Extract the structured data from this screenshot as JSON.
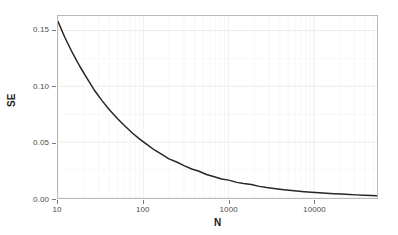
{
  "chart_data": {
    "type": "line",
    "title": "",
    "xlabel": "N",
    "ylabel": "SE",
    "xscale": "log",
    "yscale": "linear",
    "xlim": [
      10,
      55000
    ],
    "ylim": [
      0.0,
      0.163
    ],
    "grid": true,
    "legend": null,
    "formula": "SE = 0.5 / sqrt(N)",
    "xticks": [
      10,
      100,
      1000,
      10000
    ],
    "xtick_labels": [
      "10",
      "100",
      "1000",
      "10000"
    ],
    "yticks": [
      0.0,
      0.05,
      0.1,
      0.15
    ],
    "ytick_labels": [
      "0.00",
      "0.05",
      "0.10",
      "0.15"
    ],
    "series": [
      {
        "name": "SE",
        "color": "#262626",
        "x": [
          10,
          12,
          15,
          18,
          22,
          27,
          33,
          40,
          50,
          60,
          75,
          90,
          110,
          135,
          165,
          200,
          250,
          300,
          370,
          450,
          550,
          680,
          830,
          1000,
          1250,
          1500,
          1850,
          2300,
          2800,
          3400,
          4200,
          5100,
          6300,
          7700,
          9400,
          11500,
          14000,
          17200,
          21000,
          26000,
          31500,
          38500,
          47000,
          55000
        ],
        "y": [
          0.158,
          0.144,
          0.129,
          0.118,
          0.107,
          0.096,
          0.087,
          0.079,
          0.071,
          0.065,
          0.058,
          0.053,
          0.048,
          0.043,
          0.039,
          0.035,
          0.032,
          0.029,
          0.026,
          0.024,
          0.021,
          0.019,
          0.017,
          0.016,
          0.014,
          0.013,
          0.012,
          0.0104,
          0.0094,
          0.0086,
          0.0077,
          0.007,
          0.0063,
          0.0057,
          0.0052,
          0.0047,
          0.0042,
          0.0038,
          0.0035,
          0.0031,
          0.0028,
          0.0025,
          0.0023,
          0.0021
        ]
      }
    ]
  },
  "axes": {
    "y_title": "SE",
    "x_title": "N"
  },
  "style": {
    "panel_border_color": "#b9b9b9",
    "grid_color": "#f2f2f2",
    "line_color": "#262626",
    "tick_text_color": "#4d4d4d",
    "title_text_color": "#1a1a1a",
    "background": "#ffffff"
  }
}
